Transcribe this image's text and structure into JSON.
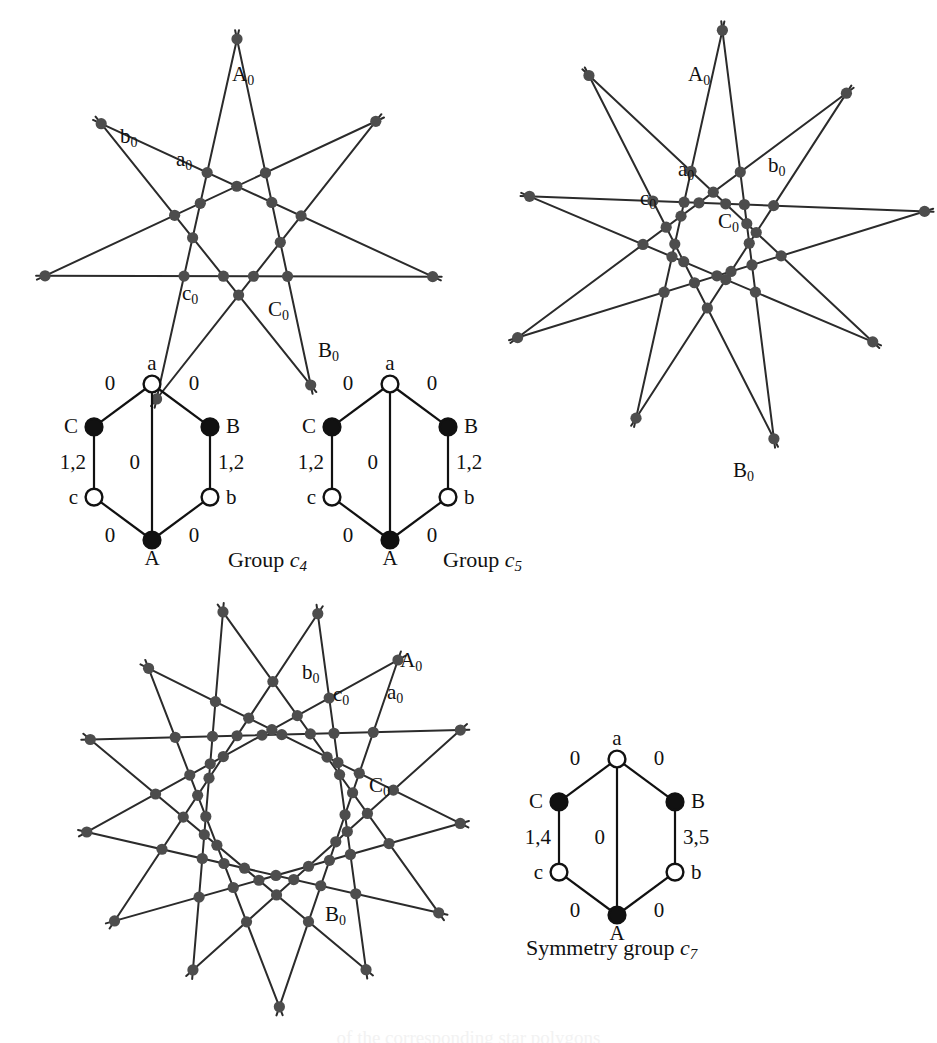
{
  "figure": {
    "background_color": "#ffffff",
    "ink_color": "#111111",
    "node_color": "#4d4d4d"
  },
  "panels": [
    {
      "id": "star-c4",
      "name": "star-polygon-c4",
      "star_points": 4,
      "labels": [
        {
          "id": "A0",
          "base": "A",
          "sub": "0",
          "x": 232,
          "y": 62
        },
        {
          "id": "b0",
          "base": "b",
          "sub": "0",
          "x": 120,
          "y": 124
        },
        {
          "id": "a0",
          "base": "a",
          "sub": "0",
          "x": 176,
          "y": 147
        },
        {
          "id": "c0",
          "base": "c",
          "sub": "0",
          "x": 182,
          "y": 281
        },
        {
          "id": "C0",
          "base": "C",
          "sub": "0",
          "x": 268,
          "y": 297
        },
        {
          "id": "B0",
          "base": "B",
          "sub": "0",
          "x": 318,
          "y": 338
        }
      ]
    },
    {
      "id": "star-c5",
      "name": "star-polygon-c5",
      "star_points": 5,
      "labels": [
        {
          "id": "A0",
          "base": "A",
          "sub": "0",
          "x": 688,
          "y": 62
        },
        {
          "id": "a0",
          "base": "a",
          "sub": "0",
          "x": 678,
          "y": 157
        },
        {
          "id": "b0",
          "base": "b",
          "sub": "0",
          "x": 768,
          "y": 153
        },
        {
          "id": "c0",
          "base": "c",
          "sub": "0",
          "x": 640,
          "y": 186
        },
        {
          "id": "C0",
          "base": "C",
          "sub": "0",
          "x": 718,
          "y": 209
        },
        {
          "id": "B0",
          "base": "B",
          "sub": "0",
          "x": 733,
          "y": 458
        }
      ]
    },
    {
      "id": "star-c7",
      "name": "star-polygon-c7",
      "star_points": 7,
      "labels": [
        {
          "id": "A0",
          "base": "A",
          "sub": "0",
          "x": 400,
          "y": 648
        },
        {
          "id": "b0",
          "base": "b",
          "sub": "0",
          "x": 302,
          "y": 660
        },
        {
          "id": "c0",
          "base": "c",
          "sub": "0",
          "x": 333,
          "y": 682
        },
        {
          "id": "a0",
          "base": "a",
          "sub": "0",
          "x": 387,
          "y": 680
        },
        {
          "id": "C0",
          "base": "C",
          "sub": "0",
          "x": 369,
          "y": 773
        },
        {
          "id": "B0",
          "base": "B",
          "sub": "0",
          "x": 325,
          "y": 902
        }
      ]
    }
  ],
  "hexagons": [
    {
      "id": "hex-c4",
      "name": "hexagon-graph-c4",
      "caption": {
        "prefix": "Group ",
        "symbol": "c",
        "subscript": "4"
      },
      "caption_x": 228,
      "caption_y": 547,
      "nodes": [
        {
          "id": "a",
          "label": "a",
          "filled": false,
          "label_pos": "top"
        },
        {
          "id": "B",
          "label": "B",
          "filled": true,
          "label_pos": "right"
        },
        {
          "id": "b",
          "label": "b",
          "filled": false,
          "label_pos": "right"
        },
        {
          "id": "A",
          "label": "A",
          "filled": true,
          "label_pos": "bottom"
        },
        {
          "id": "c",
          "label": "c",
          "filled": false,
          "label_pos": "left"
        },
        {
          "id": "C",
          "label": "C",
          "filled": true,
          "label_pos": "left"
        }
      ],
      "edge_labels": {
        "top_left": "0",
        "top_right": "0",
        "left_side": "1,2",
        "right_side": "1,2",
        "bottom_left": "0",
        "bottom_right": "0",
        "middle": "0"
      }
    },
    {
      "id": "hex-c5",
      "name": "hexagon-graph-c5",
      "caption": {
        "prefix": "Group ",
        "symbol": "c",
        "subscript": "5"
      },
      "caption_x": 443,
      "caption_y": 547,
      "nodes": [
        {
          "id": "a",
          "label": "a",
          "filled": false,
          "label_pos": "top"
        },
        {
          "id": "B",
          "label": "B",
          "filled": true,
          "label_pos": "right"
        },
        {
          "id": "b",
          "label": "b",
          "filled": false,
          "label_pos": "right"
        },
        {
          "id": "A",
          "label": "A",
          "filled": true,
          "label_pos": "bottom"
        },
        {
          "id": "c",
          "label": "c",
          "filled": false,
          "label_pos": "left"
        },
        {
          "id": "C",
          "label": "C",
          "filled": true,
          "label_pos": "left"
        }
      ],
      "edge_labels": {
        "top_left": "0",
        "top_right": "0",
        "left_side": "1,2",
        "right_side": "1,2",
        "bottom_left": "0",
        "bottom_right": "0",
        "middle": "0"
      }
    },
    {
      "id": "hex-c7",
      "name": "hexagon-graph-c7",
      "caption": {
        "prefix": "Symmetry group ",
        "symbol": "c",
        "subscript": "7"
      },
      "caption_x": 526,
      "caption_y": 935,
      "nodes": [
        {
          "id": "a",
          "label": "a",
          "filled": false,
          "label_pos": "top"
        },
        {
          "id": "B",
          "label": "B",
          "filled": true,
          "label_pos": "right"
        },
        {
          "id": "b",
          "label": "b",
          "filled": false,
          "label_pos": "right"
        },
        {
          "id": "A",
          "label": "A",
          "filled": true,
          "label_pos": "bottom"
        },
        {
          "id": "c",
          "label": "c",
          "filled": false,
          "label_pos": "left"
        },
        {
          "id": "C",
          "label": "C",
          "filled": true,
          "label_pos": "left"
        }
      ],
      "edge_labels": {
        "top_left": "0",
        "top_right": "0",
        "left_side": "1,4",
        "right_side": "3,5",
        "bottom_left": "0",
        "bottom_right": "0",
        "middle": "0"
      }
    }
  ],
  "bottom_cut_text": "of the corresponding star polygons"
}
